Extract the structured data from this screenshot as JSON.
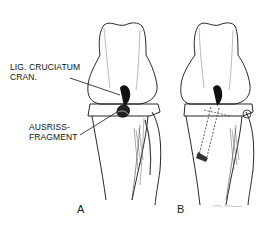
{
  "figure": {
    "labels": {
      "ligament": {
        "line1": "LIG. CRUCIATUM",
        "line2": "CRAN."
      },
      "fragment": {
        "line1": "AUSRISS-",
        "line2": "FRAGMENT"
      }
    },
    "panels": [
      {
        "id": "A",
        "letter": "A"
      },
      {
        "id": "B",
        "letter": "B"
      }
    ],
    "colors": {
      "ink": "#111111",
      "background": "#ffffff",
      "shade": "#555555"
    }
  }
}
